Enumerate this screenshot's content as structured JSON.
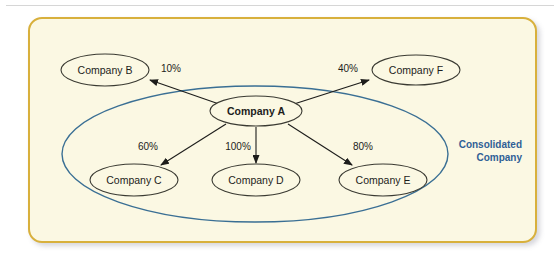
{
  "diagram": {
    "panel": {
      "background_color": "#fbf8e3",
      "border_color": "#d8b03c"
    },
    "group": {
      "label_line1": "Consolidated",
      "label_line2": "Company",
      "color": "#2f6096",
      "ellipse_stroke_color": "#3a6f94"
    },
    "nodes": [
      {
        "id": "A",
        "label": "Company A",
        "bold": true,
        "cx": 256,
        "cy": 111,
        "rx": 46,
        "ry": 15
      },
      {
        "id": "B",
        "label": "Company B",
        "bold": false,
        "cx": 105,
        "cy": 70,
        "rx": 44,
        "ry": 16
      },
      {
        "id": "F",
        "label": "Company F",
        "bold": false,
        "cx": 416,
        "cy": 70,
        "rx": 44,
        "ry": 15
      },
      {
        "id": "C",
        "label": "Company C",
        "bold": false,
        "cx": 134,
        "cy": 180,
        "rx": 44,
        "ry": 16
      },
      {
        "id": "D",
        "label": "Company D",
        "bold": false,
        "cx": 256,
        "cy": 180,
        "rx": 44,
        "ry": 16
      },
      {
        "id": "E",
        "label": "Company E",
        "bold": false,
        "cx": 383,
        "cy": 180,
        "rx": 44,
        "ry": 16
      }
    ],
    "edges": [
      {
        "from": "A",
        "to": "B",
        "percent": "10%",
        "label_x": 171,
        "label_y": 72,
        "x1": 219,
        "y1": 104,
        "x2": 150,
        "y2": 80
      },
      {
        "from": "A",
        "to": "F",
        "percent": "40%",
        "label_x": 348,
        "label_y": 72,
        "x1": 294,
        "y1": 104,
        "x2": 369,
        "y2": 80
      },
      {
        "from": "A",
        "to": "C",
        "percent": "60%",
        "label_x": 148,
        "label_y": 150,
        "x1": 226,
        "y1": 124,
        "x2": 161,
        "y2": 165
      },
      {
        "from": "A",
        "to": "D",
        "percent": "100%",
        "label_x": 238,
        "label_y": 150,
        "x1": 256,
        "y1": 127,
        "x2": 256,
        "y2": 163
      },
      {
        "from": "A",
        "to": "E",
        "percent": "80%",
        "label_x": 363,
        "label_y": 150,
        "x1": 288,
        "y1": 124,
        "x2": 352,
        "y2": 165
      }
    ],
    "group_ellipse": {
      "cx": 255,
      "cy": 154,
      "rx": 193,
      "ry": 68
    }
  }
}
